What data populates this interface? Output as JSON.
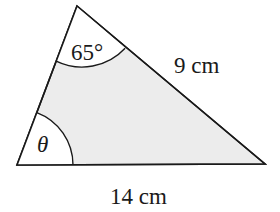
{
  "diagram": {
    "type": "triangle",
    "fill_color": "#ececec",
    "stroke_color": "#1a1a1a",
    "vertices": {
      "top": [
        77,
        6
      ],
      "bottom_left": [
        17,
        165
      ],
      "bottom_right": [
        265,
        164
      ]
    },
    "labels": {
      "top_angle": "65°",
      "bottom_left_angle": "θ",
      "right_side": "9 cm",
      "base": "14 cm"
    }
  }
}
